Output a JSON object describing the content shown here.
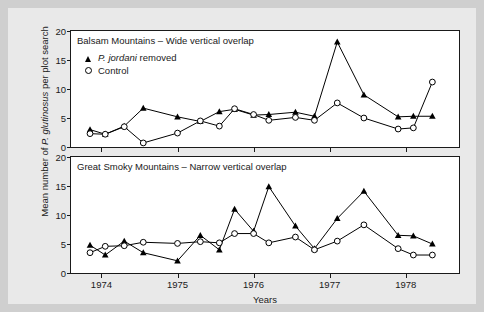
{
  "figure": {
    "background": "#e9e9e9",
    "page_background": "#cfcfcf",
    "plot_background": "#ffffff",
    "ink_color": "#000000"
  },
  "axes": {
    "ylabel_prefix": "Mean number of ",
    "ylabel_italic": "P. glutinosus",
    "ylabel_suffix": " per plot search",
    "xlabel": "Years",
    "yticks": [
      "0",
      "5",
      "10",
      "15",
      "20"
    ],
    "xticks": [
      "1974",
      "1975",
      "1976",
      "1977",
      "1978"
    ]
  },
  "legend": {
    "items": [
      {
        "marker": "triangle-marker",
        "label_italic": "P. jordani",
        "label_rest": " removed"
      },
      {
        "marker": "circle-marker",
        "label_italic": "",
        "label_rest": "Control"
      }
    ]
  },
  "panels": [
    {
      "id": "panel-top",
      "title": "Balsam Mountains – Wide vertical overlap"
    },
    {
      "id": "panel-bottom",
      "title": "Great Smoky Mountains – Narrow vertical overlap"
    }
  ],
  "chart_data": {
    "type": "line",
    "xlabel": "Years",
    "ylabel": "Mean number of P. glutinosus per plot search",
    "ylim": [
      0,
      20
    ],
    "xlim": [
      1973.6,
      1978.7
    ],
    "yticks": [
      0,
      5,
      10,
      15,
      20
    ],
    "xticks": [
      1974,
      1975,
      1976,
      1977,
      1978
    ],
    "grid": false,
    "legend_position": "top-left of first panel",
    "panels": [
      {
        "name": "Balsam Mountains – Wide vertical overlap",
        "series": [
          {
            "name": "P. jordani removed",
            "marker": "filled-triangle",
            "x": [
              1973.85,
              1974.05,
              1974.3,
              1974.55,
              1975.0,
              1975.3,
              1975.55,
              1975.75,
              1976.0,
              1976.2,
              1976.55,
              1976.8,
              1977.1,
              1977.45,
              1977.9,
              1978.1,
              1978.35
            ],
            "y": [
              3.0,
              2.2,
              3.6,
              6.7,
              5.2,
              4.4,
              6.1,
              6.5,
              5.5,
              5.6,
              6.0,
              5.3,
              18.1,
              9.0,
              5.2,
              5.3,
              5.3
            ]
          },
          {
            "name": "Control",
            "marker": "open-circle",
            "x": [
              1973.85,
              1974.05,
              1974.3,
              1974.55,
              1975.0,
              1975.3,
              1975.55,
              1975.75,
              1976.0,
              1976.2,
              1976.55,
              1976.8,
              1977.1,
              1977.45,
              1977.9,
              1978.1,
              1978.35
            ],
            "y": [
              2.3,
              2.2,
              3.5,
              0.7,
              2.4,
              4.5,
              3.6,
              6.6,
              5.6,
              4.6,
              5.1,
              4.6,
              7.6,
              5.0,
              3.1,
              3.3,
              11.2
            ]
          }
        ]
      },
      {
        "name": "Great Smoky Mountains – Narrow vertical overlap",
        "series": [
          {
            "name": "P. jordani removed",
            "marker": "filled-triangle",
            "x": [
              1973.85,
              1974.05,
              1974.3,
              1974.55,
              1975.0,
              1975.3,
              1975.55,
              1975.75,
              1976.0,
              1976.2,
              1976.55,
              1976.8,
              1977.1,
              1977.45,
              1977.9,
              1978.1,
              1978.35
            ],
            "y": [
              4.8,
              3.1,
              5.5,
              3.5,
              2.1,
              6.5,
              4.0,
              11.0,
              7.2,
              14.9,
              8.1,
              4.2,
              9.4,
              14.1,
              6.5,
              6.4,
              5.0
            ]
          },
          {
            "name": "Control",
            "marker": "open-circle",
            "x": [
              1973.85,
              1974.05,
              1974.3,
              1974.55,
              1975.0,
              1975.3,
              1975.55,
              1975.75,
              1976.0,
              1976.2,
              1976.55,
              1976.8,
              1977.1,
              1977.45,
              1977.9,
              1978.1,
              1978.35
            ],
            "y": [
              3.5,
              4.6,
              4.7,
              5.3,
              5.1,
              5.4,
              5.2,
              6.8,
              6.8,
              5.2,
              6.2,
              4.0,
              5.5,
              8.3,
              4.2,
              3.1,
              3.1
            ]
          }
        ]
      }
    ]
  }
}
